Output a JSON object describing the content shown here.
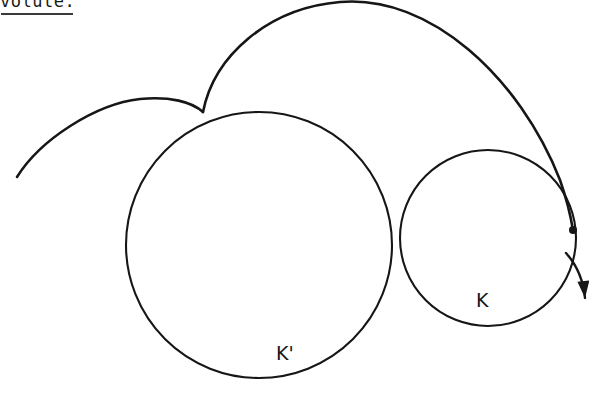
{
  "figure": {
    "caption": {
      "text": "volute.",
      "underline": true,
      "clipped_at_top": true
    },
    "background_color": "#ffffff",
    "ink_color": "#161616",
    "width": 589,
    "height": 394,
    "labels": [
      {
        "name": "K",
        "text": "K",
        "x": 486,
        "y": 303
      },
      {
        "name": "K-prime",
        "text": "K'",
        "x": 286,
        "y": 356
      }
    ],
    "circles": [
      {
        "name": "K-prime",
        "label": "K'",
        "cx": 259,
        "cy": 245,
        "r": 133,
        "role": "large-base-circle"
      },
      {
        "name": "K",
        "label": "K",
        "cx": 488,
        "cy": 238,
        "r": 88,
        "role": "small-rolling-circle"
      }
    ],
    "markers": [
      {
        "name": "tracing-point",
        "type": "dot",
        "x": 573,
        "y": 230,
        "r": 4
      }
    ],
    "arrow": {
      "name": "direction-arrow",
      "from_x": 566,
      "from_y": 253,
      "to_x": 585,
      "to_y": 298,
      "direction": "down-right"
    },
    "cusp": {
      "name": "cusp-point",
      "x": 203,
      "y": 112
    },
    "arcs": [
      {
        "name": "left-involute-arc",
        "description": "short arc from lower-left rising to the cusp",
        "path": "M 17 177 C 40 140 95 104 140 99 C 170 96 192 102 203 112"
      },
      {
        "name": "main-involute-arc",
        "description": "large arc sweeping from the cusp over the top and down to the tracing point",
        "path": "M 203 112 C 214 56 268 8 340 2 C 430 -6 520 78 560 180 C 567 200 571 218 573 230"
      }
    ]
  }
}
